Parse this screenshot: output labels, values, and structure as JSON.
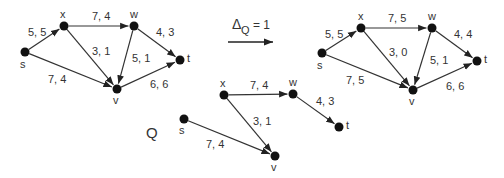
{
  "transition": {
    "symbol": "Δ",
    "subscript": "Q",
    "equals": "= 1"
  },
  "q_label": "Q",
  "graphs": [
    {
      "id": "before",
      "nodes": [
        {
          "id": "s",
          "label": "s",
          "x": 25,
          "y": 52,
          "lx": 20,
          "ly": 68
        },
        {
          "id": "x",
          "label": "x",
          "x": 64,
          "y": 26,
          "lx": 60,
          "ly": 18
        },
        {
          "id": "w",
          "label": "w",
          "x": 134,
          "y": 26,
          "lx": 130,
          "ly": 18
        },
        {
          "id": "t",
          "label": "t",
          "x": 180,
          "y": 60,
          "lx": 187,
          "ly": 62
        },
        {
          "id": "v",
          "label": "v",
          "x": 117,
          "y": 89,
          "lx": 113,
          "ly": 104
        }
      ],
      "edges": [
        {
          "from": "s",
          "to": "x",
          "label": "5, 5",
          "lx": 28,
          "ly": 36
        },
        {
          "from": "x",
          "to": "w",
          "label": "7, 4",
          "lx": 92,
          "ly": 20
        },
        {
          "from": "x",
          "to": "v",
          "label": "3, 1",
          "lx": 92,
          "ly": 55
        },
        {
          "from": "s",
          "to": "v",
          "label": "7, 4",
          "lx": 48,
          "ly": 83
        },
        {
          "from": "w",
          "to": "v",
          "label": "5, 1",
          "lx": 132,
          "ly": 62
        },
        {
          "from": "w",
          "to": "t",
          "label": "4, 3",
          "lx": 156,
          "ly": 36
        },
        {
          "from": "v",
          "to": "t",
          "label": "6, 6",
          "lx": 150,
          "ly": 88
        }
      ]
    },
    {
      "id": "after",
      "nodes": [
        {
          "id": "s",
          "label": "s",
          "x": 322,
          "y": 53,
          "lx": 317,
          "ly": 69
        },
        {
          "id": "x",
          "label": "x",
          "x": 361,
          "y": 28,
          "lx": 358,
          "ly": 20
        },
        {
          "id": "w",
          "label": "w",
          "x": 432,
          "y": 28,
          "lx": 428,
          "ly": 20
        },
        {
          "id": "t",
          "label": "t",
          "x": 477,
          "y": 61,
          "lx": 484,
          "ly": 63
        },
        {
          "id": "v",
          "label": "v",
          "x": 413,
          "y": 90,
          "lx": 409,
          "ly": 105
        }
      ],
      "edges": [
        {
          "from": "s",
          "to": "x",
          "label": "5, 5",
          "lx": 325,
          "ly": 38
        },
        {
          "from": "x",
          "to": "w",
          "label": "7, 5",
          "lx": 388,
          "ly": 22
        },
        {
          "from": "x",
          "to": "v",
          "label": "3, 0",
          "lx": 389,
          "ly": 56
        },
        {
          "from": "s",
          "to": "v",
          "label": "7, 5",
          "lx": 346,
          "ly": 84
        },
        {
          "from": "w",
          "to": "v",
          "label": "5, 1",
          "lx": 430,
          "ly": 64
        },
        {
          "from": "w",
          "to": "t",
          "label": "4, 4",
          "lx": 454,
          "ly": 38
        },
        {
          "from": "v",
          "to": "t",
          "label": "6, 6",
          "lx": 446,
          "ly": 90
        }
      ]
    },
    {
      "id": "Q",
      "nodes": [
        {
          "id": "s",
          "label": "s",
          "x": 184,
          "y": 119,
          "lx": 179,
          "ly": 134
        },
        {
          "id": "x",
          "label": "x",
          "x": 224,
          "y": 95,
          "lx": 220,
          "ly": 87
        },
        {
          "id": "w",
          "label": "w",
          "x": 293,
          "y": 94,
          "lx": 289,
          "ly": 86
        },
        {
          "id": "t",
          "label": "t",
          "x": 339,
          "y": 127,
          "lx": 346,
          "ly": 129
        },
        {
          "id": "v",
          "label": "v",
          "x": 275,
          "y": 156,
          "lx": 271,
          "ly": 171
        }
      ],
      "edges": [
        {
          "from": "x",
          "to": "w",
          "label": "7, 4",
          "lx": 250,
          "ly": 89
        },
        {
          "from": "x",
          "to": "v",
          "label": "3, 1",
          "lx": 253,
          "ly": 125
        },
        {
          "from": "s",
          "to": "v",
          "label": "7, 4",
          "lx": 206,
          "ly": 148
        },
        {
          "from": "w",
          "to": "t",
          "label": "4, 3",
          "lx": 316,
          "ly": 105
        }
      ]
    }
  ],
  "arrow": {
    "x1": 228,
    "y1": 42,
    "x2": 273,
    "y2": 42
  }
}
